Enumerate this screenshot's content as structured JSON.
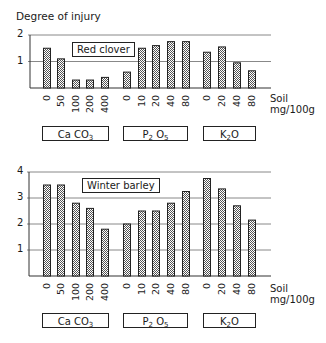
{
  "y_axis_title": "Degree of injury",
  "x_axis_unit_line1": "Soil",
  "x_axis_unit_line2": "mg/100g",
  "colors": {
    "bar_outline": "#222222",
    "bar_dot": "#555555",
    "gridline": "#888888",
    "axis": "#333333"
  },
  "groups": [
    {
      "label": "Ca CO",
      "sub": "3",
      "ticks": [
        "0",
        "50",
        "100",
        "200",
        "400"
      ]
    },
    {
      "label": "P",
      "sub": "2",
      "label2": " O",
      "sub2": "5",
      "ticks": [
        "0",
        "10",
        "20",
        "40",
        "80"
      ]
    },
    {
      "label": "K",
      "sub": "2",
      "label2": "O",
      "ticks": [
        "0",
        "20",
        "40",
        "80"
      ]
    }
  ],
  "chart_data": [
    {
      "type": "bar",
      "title": "Red clover",
      "ylabel": "Degree of injury",
      "xlabel": "Soil mg/100g",
      "ylim": [
        0,
        2
      ],
      "yticks": [
        "1",
        "2"
      ],
      "grid": true,
      "categories": [
        "CaCO3 0",
        "CaCO3 50",
        "CaCO3 100",
        "CaCO3 200",
        "CaCO3 400",
        "P2O5 0",
        "P2O5 10",
        "P2O5 20",
        "P2O5 40",
        "P2O5 80",
        "K2O 0",
        "K2O 20",
        "K2O 40",
        "K2O 80"
      ],
      "groups": [
        {
          "name": "CaCO3",
          "x": [
            "0",
            "50",
            "100",
            "200",
            "400"
          ],
          "values": [
            1.5,
            1.1,
            0.3,
            0.3,
            0.4
          ]
        },
        {
          "name": "P2O5",
          "x": [
            "0",
            "10",
            "20",
            "40",
            "80"
          ],
          "values": [
            0.6,
            1.5,
            1.6,
            1.75,
            1.75
          ]
        },
        {
          "name": "K2O",
          "x": [
            "0",
            "20",
            "40",
            "80"
          ],
          "values": [
            1.35,
            1.55,
            0.95,
            0.65
          ]
        }
      ],
      "values": [
        1.5,
        1.1,
        0.3,
        0.3,
        0.4,
        0.6,
        1.5,
        1.6,
        1.75,
        1.75,
        1.35,
        1.55,
        0.95,
        0.65
      ]
    },
    {
      "type": "bar",
      "title": "Winter barley",
      "ylabel": "Degree of injury",
      "xlabel": "Soil mg/100g",
      "ylim": [
        0,
        4
      ],
      "yticks": [
        "1",
        "2",
        "3",
        "4"
      ],
      "grid": true,
      "categories": [
        "CaCO3 0",
        "CaCO3 50",
        "CaCO3 100",
        "CaCO3 200",
        "CaCO3 400",
        "P2O5 0",
        "P2O5 10",
        "P2O5 20",
        "P2O5 40",
        "P2O5 80",
        "K2O 0",
        "K2O 20",
        "K2O 40",
        "K2O 80"
      ],
      "groups": [
        {
          "name": "CaCO3",
          "x": [
            "0",
            "50",
            "100",
            "200",
            "400"
          ],
          "values": [
            3.5,
            3.5,
            2.8,
            2.6,
            1.8
          ]
        },
        {
          "name": "P2O5",
          "x": [
            "0",
            "10",
            "20",
            "40",
            "80"
          ],
          "values": [
            2.0,
            2.5,
            2.5,
            2.8,
            3.25
          ]
        },
        {
          "name": "K2O",
          "x": [
            "0",
            "20",
            "40",
            "80"
          ],
          "values": [
            3.75,
            3.35,
            2.7,
            2.15
          ]
        }
      ],
      "values": [
        3.5,
        3.5,
        2.8,
        2.6,
        1.8,
        2.0,
        2.5,
        2.5,
        2.8,
        3.25,
        3.75,
        3.35,
        2.7,
        2.15
      ]
    }
  ]
}
